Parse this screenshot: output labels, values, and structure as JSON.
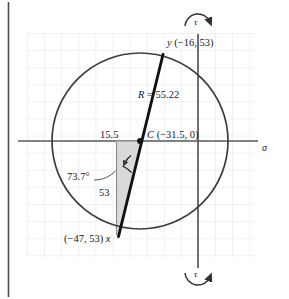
{
  "figure": {
    "type": "mohrs-circle",
    "axes": {
      "horizontal_label": "σ",
      "vertical_label_top": "τ",
      "vertical_label_bottom": "τ"
    },
    "labels": {
      "point_y": "y (−16, 53)",
      "point_x": "(−47, 53) x",
      "center": "C (−31.5, 0)",
      "radius": "R = 55.22",
      "radius_symbol": "R",
      "radius_value": "= 55.22",
      "leg_horizontal": "15.5",
      "leg_vertical": "53",
      "angle": "73.7°"
    }
  },
  "chart_data": {
    "type": "scatter",
    "title": "",
    "xlabel": "σ",
    "ylabel": "τ",
    "grid": true,
    "legend": "none",
    "center": {
      "label": "C",
      "x": -31.5,
      "y": 0
    },
    "radius": 55.22,
    "points": [
      {
        "label": "y",
        "x": -16,
        "y": 53
      },
      {
        "label": "x",
        "x": -47,
        "y": 53
      }
    ],
    "triangle_legs": {
      "horizontal": 15.5,
      "vertical": 53
    },
    "angle_deg": 73.7,
    "rotation_markers": [
      "τ",
      "τ"
    ]
  },
  "colors": {
    "grid": "#dfe3ea",
    "axis": "#56585c",
    "circle": "#3c3e40",
    "line": "#111111",
    "shade": "#d6d6d6",
    "text": "#17181a",
    "border": "#4a4c50"
  }
}
